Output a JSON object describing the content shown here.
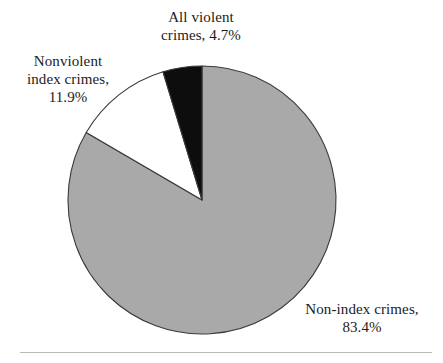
{
  "figure": {
    "background_color": "#ffffff",
    "text_color": "#1c1c1c",
    "rule_color": "#b9b9b9"
  },
  "chart_data": {
    "type": "pie",
    "title": "",
    "subtitle": "",
    "xlabel": "",
    "ylabel": "",
    "legend_position": "none",
    "grid": false,
    "start_angle_deg": 90,
    "direction": "counterclockwise",
    "center": {
      "x": 202,
      "y": 200
    },
    "radius": 134,
    "labels": [
      "All violent crimes",
      "Nonviolent index crimes",
      "Non-index crimes"
    ],
    "values": [
      4.7,
      11.9,
      83.4
    ],
    "value_suffix": "%",
    "colors": [
      "#0d0d0d",
      "#ffffff",
      "#a9a9a9"
    ],
    "slice_outline_color": "#3a3a3a",
    "slices": [
      {
        "name": "all-violent-crimes",
        "label": "All violent crimes",
        "value": 4.7,
        "value_text": "4.7%",
        "color": "#0d0d0d",
        "label_lines": [
          "All violent",
          "crimes, 4.7%"
        ]
      },
      {
        "name": "nonviolent-index-crimes",
        "label": "Nonviolent index crimes",
        "value": 11.9,
        "value_text": "11.9%",
        "color": "#ffffff",
        "label_lines": [
          "Nonviolent",
          "index crimes,",
          "11.9%"
        ]
      },
      {
        "name": "non-index-crimes",
        "label": "Non-index crimes",
        "value": 83.4,
        "value_text": "83.4%",
        "color": "#a9a9a9",
        "label_lines": [
          "Non-index crimes,",
          "83.4%"
        ]
      }
    ]
  },
  "labels": {
    "violent": {
      "line1": "All violent",
      "line2": "crimes, 4.7%"
    },
    "nonviolent": {
      "line1": "Nonviolent",
      "line2": "index crimes,",
      "line3": "11.9%"
    },
    "nonindex": {
      "line1": "Non-index crimes,",
      "line2": "83.4%"
    }
  }
}
